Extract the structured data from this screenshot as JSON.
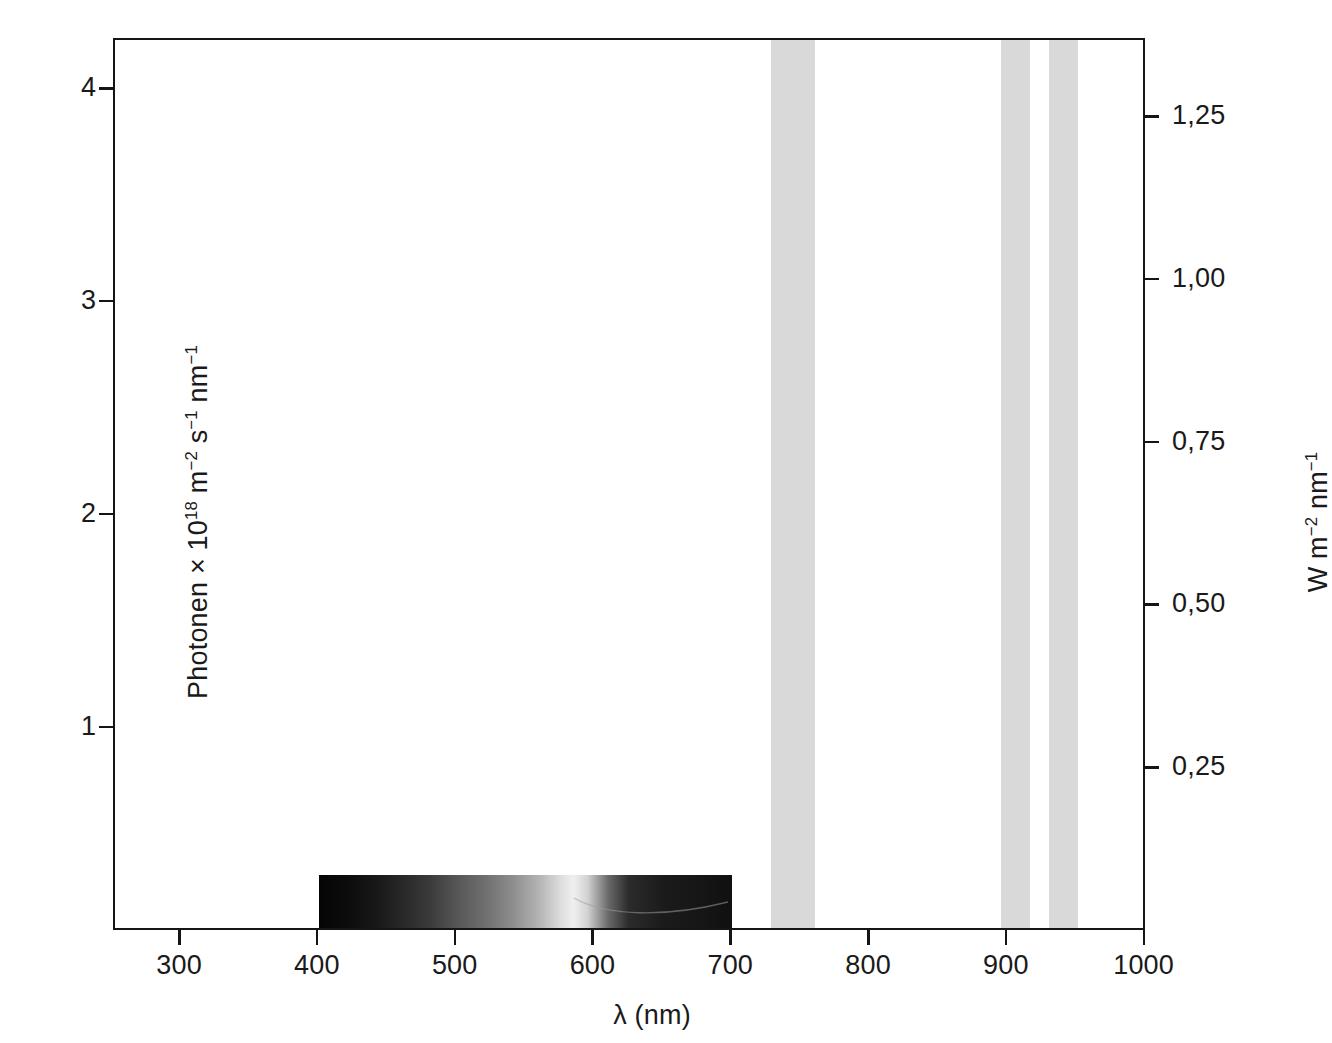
{
  "figure": {
    "background_color": "#ffffff",
    "axis_color": "#151515",
    "band_color": "#d9d9d9"
  },
  "axes": {
    "x": {
      "title_parts": {
        "symbol": "λ",
        "unit": "(nm)"
      },
      "title": "λ (nm)",
      "ticks": [
        300,
        400,
        500,
        600,
        700,
        800,
        900,
        1000
      ],
      "tick_labels": [
        "300",
        "400",
        "500",
        "600",
        "700",
        "800",
        "900",
        "1000"
      ],
      "min": 252,
      "max": 1001
    },
    "y_left": {
      "title_text": "Photonen × 10",
      "title_exp": "18",
      "title_mid": " m",
      "title_exp2": "−2",
      "title_mid2": " s",
      "title_exp3": "−1",
      "title_mid3": " nm",
      "title_exp4": "−1",
      "title": "Photonen × 10¹⁸ m⁻² s⁻¹ nm⁻¹",
      "ticks": [
        1,
        2,
        3,
        4
      ],
      "tick_labels": [
        "1",
        "2",
        "3",
        "4"
      ],
      "min": 0.045,
      "max": 4.235
    },
    "y_right": {
      "title_text": "W m",
      "title_exp": "−2",
      "title_mid": " nm",
      "title_exp2": "−1",
      "title": "W m⁻² nm⁻¹",
      "ticks": [
        0.25,
        0.5,
        0.75,
        1.0,
        1.25
      ],
      "tick_labels": [
        "0,25",
        "0,50",
        "0,75",
        "1,00",
        "1,25"
      ],
      "min": 0.0,
      "max": 1.37
    }
  },
  "chart_data": {
    "type": "area",
    "title": "",
    "xlabel": "λ (nm)",
    "ylabel": "Photonen × 10¹⁸ m⁻² s⁻¹ nm⁻¹",
    "ylabel_right": "W m⁻² nm⁻¹",
    "xlim": [
      252,
      1001
    ],
    "ylim": [
      0.045,
      4.235
    ],
    "ylim_right": [
      0.0,
      1.37
    ],
    "grid": false,
    "legend": "none",
    "xticks": [
      300,
      400,
      500,
      600,
      700,
      800,
      900,
      1000
    ],
    "yticks_left": [
      1,
      2,
      3,
      4
    ],
    "yticks_right": [
      0.25,
      0.5,
      0.75,
      1.0,
      1.25
    ],
    "annotations": [
      {
        "name": "visible-spectrum-strip",
        "kind": "image-strip",
        "x_start": 400,
        "x_end": 700,
        "description": "Grayscale rendering of the visible spectrum from violet to red"
      },
      {
        "name": "nir-band-1",
        "kind": "shaded-band",
        "x_start": 728,
        "x_end": 760,
        "color": "#d9d9d9"
      },
      {
        "name": "nir-band-2",
        "kind": "shaded-band",
        "x_start": 895,
        "x_end": 916,
        "color": "#d9d9d9"
      },
      {
        "name": "nir-band-3",
        "kind": "shaded-band",
        "x_start": 930,
        "x_end": 951,
        "color": "#d9d9d9"
      }
    ],
    "bands": [
      {
        "label": "band-1",
        "x_start": 728,
        "x_end": 760
      },
      {
        "label": "band-2",
        "x_start": 895,
        "x_end": 916
      },
      {
        "label": "band-3",
        "x_start": 930,
        "x_end": 951
      }
    ],
    "spectrum_stops": [
      {
        "x": 400,
        "gray": "#050505"
      },
      {
        "x": 420,
        "gray": "#0b0b0b"
      },
      {
        "x": 440,
        "gray": "#171717"
      },
      {
        "x": 460,
        "gray": "#272727"
      },
      {
        "x": 480,
        "gray": "#3a3a3a"
      },
      {
        "x": 500,
        "gray": "#565656"
      },
      {
        "x": 520,
        "gray": "#6e6e6e"
      },
      {
        "x": 540,
        "gray": "#8c8c8c"
      },
      {
        "x": 560,
        "gray": "#b4b4b4"
      },
      {
        "x": 575,
        "gray": "#dcdcdc"
      },
      {
        "x": 585,
        "gray": "#f0f0f0"
      },
      {
        "x": 595,
        "gray": "#d2d2d2"
      },
      {
        "x": 610,
        "gray": "#6a6a6a"
      },
      {
        "x": 625,
        "gray": "#2b2b2b"
      },
      {
        "x": 650,
        "gray": "#1b1b1b"
      },
      {
        "x": 680,
        "gray": "#151515"
      },
      {
        "x": 700,
        "gray": "#101010"
      }
    ]
  }
}
